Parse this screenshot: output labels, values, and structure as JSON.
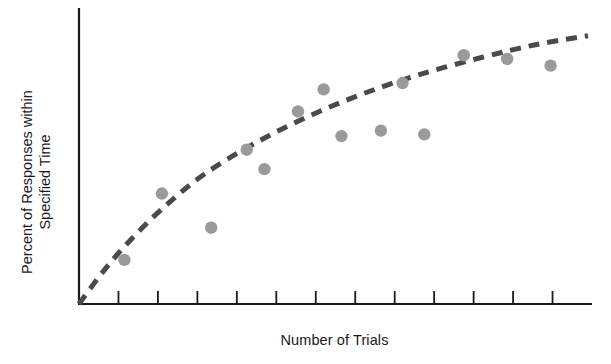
{
  "chart_data": {
    "type": "scatter",
    "title": "",
    "subtitle": "",
    "xlabel": "Number of Trials",
    "ylabel_line1": "Percent of Responses within",
    "ylabel_line2": "Specified Time",
    "ylabel": "Percent of Responses within Specified Time",
    "grid": false,
    "legend": false,
    "legend_position": "none",
    "x_tick_labels": [],
    "y_tick_labels": [],
    "x_tick_count": 12,
    "xlim": [
      0,
      13
    ],
    "ylim": [
      0,
      100
    ],
    "axis_color": "#1a1a1a",
    "point_color": "#9a9a9a",
    "trend_color": "#4a4a4a",
    "series": [
      {
        "name": "Observed responses",
        "marker": "circle",
        "points": [
          {
            "x": 1.15,
            "y": 15.2
          },
          {
            "x": 2.1,
            "y": 38.1
          },
          {
            "x": 3.35,
            "y": 26.3
          },
          {
            "x": 4.25,
            "y": 53.2
          },
          {
            "x": 4.7,
            "y": 46.5
          },
          {
            "x": 5.55,
            "y": 66.4
          },
          {
            "x": 6.65,
            "y": 57.9
          },
          {
            "x": 7.65,
            "y": 59.8
          },
          {
            "x": 8.2,
            "y": 76.2
          },
          {
            "x": 8.75,
            "y": 58.5
          },
          {
            "x": 9.75,
            "y": 85.8
          },
          {
            "x": 10.85,
            "y": 84.5
          },
          {
            "x": 11.95,
            "y": 82.2
          },
          {
            "x": 6.2,
            "y": 74.0
          }
        ]
      }
    ],
    "trend": {
      "name": "Fitted learning curve",
      "style": "dashed",
      "description": "negatively accelerated growth curve rising from origin",
      "points": [
        {
          "x": 0.0,
          "y": 0.0
        },
        {
          "x": 0.6,
          "y": 11.0
        },
        {
          "x": 1.3,
          "y": 22.0
        },
        {
          "x": 2.2,
          "y": 34.0
        },
        {
          "x": 3.2,
          "y": 45.0
        },
        {
          "x": 4.4,
          "y": 55.0
        },
        {
          "x": 5.7,
          "y": 64.0
        },
        {
          "x": 7.1,
          "y": 72.0
        },
        {
          "x": 8.6,
          "y": 79.0
        },
        {
          "x": 10.2,
          "y": 85.0
        },
        {
          "x": 11.6,
          "y": 89.5
        },
        {
          "x": 12.9,
          "y": 92.5
        }
      ]
    }
  }
}
